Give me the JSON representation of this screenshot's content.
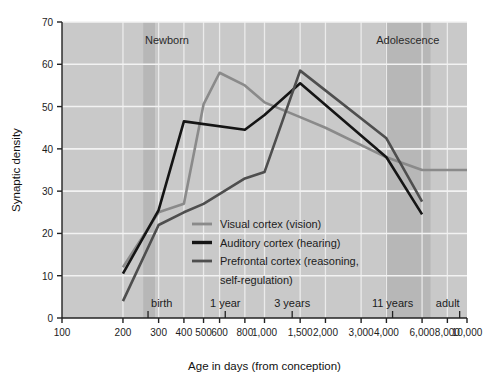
{
  "chart_data": {
    "type": "line",
    "title": "",
    "xlabel": "Age in days (from conception)",
    "ylabel": "Synaptic density",
    "xscale": "log",
    "xlim": [
      100,
      10000
    ],
    "ylim": [
      0,
      70
    ],
    "grid": true,
    "legend_position": "center-bottom",
    "x_ticks": [
      100,
      200,
      300,
      400,
      500,
      600,
      800,
      1000,
      1500,
      2000,
      3000,
      4000,
      6000,
      8000,
      10000
    ],
    "x_tick_labels": [
      "100",
      "200",
      "300",
      "400",
      "500",
      "600",
      "800",
      "1,000",
      "1,500",
      "2,000",
      "3,000",
      "4,000",
      "6,000",
      "8,000",
      "10,000"
    ],
    "y_ticks": [
      0,
      10,
      20,
      30,
      40,
      50,
      60,
      70
    ],
    "y_tick_labels": [
      "0",
      "10",
      "20",
      "30",
      "40",
      "50",
      "60",
      "70"
    ],
    "stage_markers": [
      {
        "label": "birth",
        "x": 266
      },
      {
        "label": "1 year",
        "x": 640
      },
      {
        "label": "3 years",
        "x": 1370
      },
      {
        "label": "11 years",
        "x": 4290
      },
      {
        "label": "adult",
        "x": 9200
      }
    ],
    "bands": [
      {
        "label": "Newborn",
        "x_start": 252,
        "x_end": 288,
        "label_x": 330
      },
      {
        "label": "Adolescence",
        "x_start": 3950,
        "x_end": 6600,
        "label_x": 5100
      }
    ],
    "series": [
      {
        "name": "Visual cortex (vision)",
        "color": "#8a8a8a",
        "width": 2.6,
        "points": [
          [
            200,
            12
          ],
          [
            300,
            25
          ],
          [
            400,
            27
          ],
          [
            500,
            50.5
          ],
          [
            600,
            58
          ],
          [
            800,
            55
          ],
          [
            1000,
            51
          ],
          [
            1500,
            47.5
          ],
          [
            2000,
            45
          ],
          [
            4000,
            38
          ],
          [
            6000,
            35
          ],
          [
            10000,
            35
          ]
        ]
      },
      {
        "name": "Auditory cortex (hearing)",
        "color": "#151515",
        "width": 2.6,
        "points": [
          [
            200,
            10.5
          ],
          [
            300,
            25.5
          ],
          [
            400,
            46.5
          ],
          [
            800,
            44.5
          ],
          [
            1000,
            48
          ],
          [
            1500,
            55.5
          ],
          [
            4000,
            38
          ],
          [
            6000,
            24.5
          ]
        ]
      },
      {
        "name": "Prefrontal cortex (reasoning, self-regulation)",
        "color": "#4e4e4e",
        "width": 2.6,
        "points": [
          [
            200,
            4
          ],
          [
            300,
            22
          ],
          [
            400,
            25
          ],
          [
            500,
            27
          ],
          [
            800,
            33
          ],
          [
            1000,
            34.5
          ],
          [
            1500,
            58.5
          ],
          [
            4000,
            42.5
          ],
          [
            6000,
            27.5
          ]
        ]
      }
    ]
  },
  "legend": {
    "items": [
      {
        "label": "Visual cortex (vision)",
        "color": "#8a8a8a"
      },
      {
        "label": "Auditory cortex (hearing)",
        "color": "#151515"
      },
      {
        "label": "Prefrontal cortex (reasoning,",
        "color": "#4e4e4e"
      },
      {
        "label": "self-regulation)",
        "color": ""
      }
    ]
  },
  "colors": {
    "plot_background": "#c9c9c9",
    "band_fill": "#b0b0b0",
    "grid": "#f2f2f2",
    "axis": "#222222",
    "page_background": "#ffffff"
  }
}
